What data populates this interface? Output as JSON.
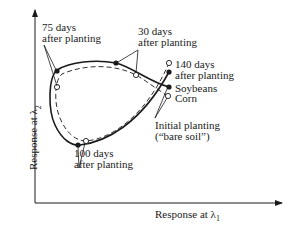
{
  "diagram": {
    "x_axis_label": "Response at λ",
    "x_axis_sub": "1",
    "y_axis_label": "Response at λ",
    "y_axis_sub": "2",
    "series": [
      {
        "name": "Soybeans",
        "line_style": "solid",
        "marker": "filled-circle"
      },
      {
        "name": "Corn",
        "line_style": "dashed",
        "marker": "open-circle"
      }
    ],
    "annotations": {
      "d75_line1": "75 days",
      "d75_line2": "after planting",
      "d30_line1": "30 days",
      "d30_line2": "after planting",
      "d140_line1": "140 days",
      "d140_line2": "after planting",
      "soybeans": "Soybeans",
      "corn": "Corn",
      "initial_line1": "Initial planting",
      "initial_line2": "(“bare soil”)",
      "d100_line1": "100 days",
      "d100_line2": "after planting"
    },
    "colors": {
      "ink": "#1a1a1a",
      "background": "#ffffff"
    }
  }
}
